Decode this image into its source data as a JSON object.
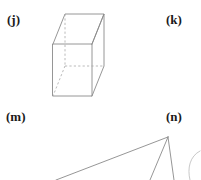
{
  "page": {
    "background_color": "#ffffff",
    "width": 201,
    "height": 180
  },
  "style": {
    "solid_edge_color": "#8a8a8a",
    "hidden_edge_color": "#a8a8a8",
    "faint_edge_color": "#c2c2c2",
    "label_color": "#1a1a1a"
  },
  "labels": [
    {
      "id": "j",
      "text": "(j)"
    },
    {
      "id": "k",
      "text": "(k)"
    },
    {
      "id": "m",
      "text": "(m)"
    },
    {
      "id": "n",
      "text": "(n)"
    }
  ],
  "figures": {
    "cuboid": {
      "label_ref": "j",
      "shape_name": "rectangular prism",
      "visible_solid_edges": true,
      "hidden_dashed_edges": true
    },
    "pyramid": {
      "label_ref": "n",
      "shape_name": "pyramid",
      "clipped_at_bottom": true
    },
    "arc": {
      "shape_name": "partial curve",
      "clipped_at_right": true
    }
  }
}
